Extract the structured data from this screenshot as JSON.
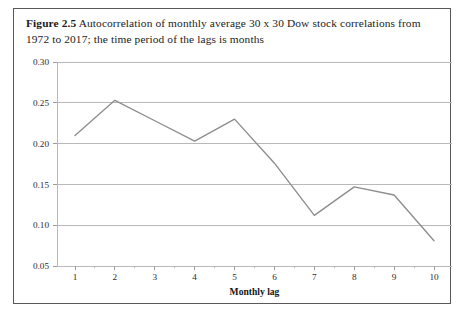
{
  "figure": {
    "caption_label": "Figure 2.5",
    "caption_text": "Autocorrelation of monthly average 30 x 30 Dow stock correlations from 1972 to 2017; the time period of the lags is months",
    "frame_color": "#58585a",
    "line_color": "#8d8d90",
    "grid_color": "#b9b9bb"
  },
  "chart_data": {
    "type": "line",
    "title": "",
    "xlabel": "Monthly lag",
    "ylabel": "",
    "categories": [
      1,
      2,
      3,
      4,
      5,
      6,
      7,
      8,
      9,
      10
    ],
    "values": [
      0.21,
      0.253,
      0.228,
      0.203,
      0.23,
      0.176,
      0.112,
      0.147,
      0.137,
      0.081
    ],
    "x": [
      1,
      2,
      3,
      4,
      5,
      6,
      7,
      8,
      9,
      10
    ],
    "xlim": [
      0.55,
      10.45
    ],
    "ylim": [
      0.05,
      0.3
    ],
    "xticks": [
      1,
      2,
      3,
      4,
      5,
      6,
      7,
      8,
      9,
      10
    ],
    "xtick_labels": [
      "1",
      "2",
      "3",
      "4",
      "5",
      "6",
      "7",
      "8",
      "9",
      "10"
    ],
    "yticks": [
      0.05,
      0.1,
      0.15,
      0.2,
      0.25,
      0.3
    ],
    "ytick_labels": [
      "0.05",
      "0.10",
      "0.15",
      "0.20",
      "0.25",
      "0.30"
    ],
    "minor_xticks": [
      1.5,
      2.5,
      3.5,
      4.5,
      5.5,
      6.5,
      7.5,
      8.5,
      9.5
    ],
    "grid": "horizontal",
    "legend": "none",
    "series_name": "Autocorrelation"
  }
}
